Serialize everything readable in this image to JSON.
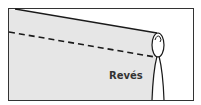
{
  "diagram": {
    "type": "sewing-hem-illustration",
    "label": "Revés",
    "colors": {
      "background": "#ffffff",
      "fabric": "#e6e6e6",
      "line": "#1a1a1a",
      "frame": "#333333",
      "label": "#333333"
    },
    "elements": [
      "frame",
      "fabric-wrong-side",
      "fabric-top-edge",
      "stitch-line-dashed",
      "rolled-hem-loop",
      "hem-fold-lines"
    ]
  }
}
